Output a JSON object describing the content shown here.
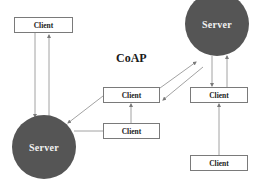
{
  "diagram": {
    "title": "CoAP",
    "servers": [
      {
        "id": "server-left",
        "label": "Server"
      },
      {
        "id": "server-right",
        "label": "Server"
      }
    ],
    "clients": [
      {
        "id": "client-top-left",
        "label": "Client"
      },
      {
        "id": "client-middle-upper",
        "label": "Client"
      },
      {
        "id": "client-middle-lower",
        "label": "Client"
      },
      {
        "id": "client-right",
        "label": "Client"
      },
      {
        "id": "client-bottom-right",
        "label": "Client"
      }
    ],
    "connections": [
      {
        "from": "client-top-left",
        "to": "server-left",
        "direction": "down"
      },
      {
        "from": "server-left",
        "to": "client-top-left",
        "direction": "up"
      },
      {
        "from": "client-middle-upper",
        "to": "server-right",
        "direction": "diagonal-up"
      },
      {
        "from": "server-right",
        "to": "client-middle-upper",
        "direction": "diagonal-down"
      },
      {
        "from": "client-middle-upper",
        "to": "server-left",
        "direction": "diagonal-down"
      },
      {
        "from": "client-middle-lower",
        "to": "client-middle-upper",
        "direction": "up"
      },
      {
        "from": "client-middle-lower",
        "to": "server-left",
        "direction": "line"
      },
      {
        "from": "server-right",
        "to": "client-right",
        "direction": "down"
      },
      {
        "from": "client-right",
        "to": "server-right",
        "direction": "up"
      },
      {
        "from": "client-bottom-right",
        "to": "client-right",
        "direction": "up"
      }
    ],
    "colors": {
      "server_fill": "#555555",
      "server_text": "#f2f2f2",
      "box_border": "#7a7a7a",
      "line": "#8a8a8a"
    }
  }
}
